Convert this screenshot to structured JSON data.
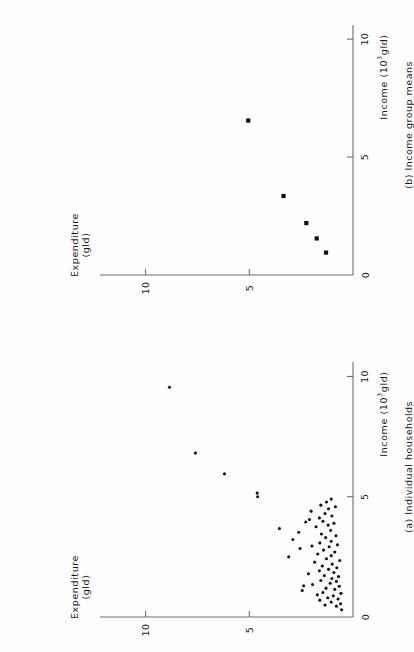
{
  "figure": {
    "orientation": "rotated-90-ccw",
    "background": "#fefefe",
    "ink_color": "#1b1b1b",
    "axis_color": "#6d6d6d",
    "point_color": "#101010"
  },
  "chart_data": [
    {
      "id": "panel-a",
      "type": "scatter",
      "title": "(a) Individual households",
      "xlabel": "Income (10³gld)",
      "ylabel": "Expenditure (gld)",
      "xticks": [
        0,
        5,
        10
      ],
      "xticklabels": [
        "0",
        "5",
        "10"
      ],
      "yticks": [
        0,
        5,
        10
      ],
      "yticklabels": [
        "0",
        "5",
        "10"
      ],
      "xlim": [
        0,
        10.6
      ],
      "ylim": [
        0,
        12.2
      ],
      "grid": false,
      "legend": null,
      "marker": "filled-circle",
      "n_points": 72,
      "points": [
        [
          0.3,
          0.55
        ],
        [
          0.45,
          0.8
        ],
        [
          0.5,
          1.35
        ],
        [
          0.55,
          0.6
        ],
        [
          0.62,
          1.05
        ],
        [
          0.7,
          1.6
        ],
        [
          0.75,
          0.72
        ],
        [
          0.8,
          1.22
        ],
        [
          0.88,
          0.95
        ],
        [
          0.92,
          1.72
        ],
        [
          0.98,
          0.58
        ],
        [
          1.02,
          1.45
        ],
        [
          1.1,
          2.45
        ],
        [
          1.15,
          0.88
        ],
        [
          1.2,
          1.3
        ],
        [
          1.28,
          0.66
        ],
        [
          1.35,
          1.95
        ],
        [
          1.4,
          1.1
        ],
        [
          1.48,
          0.8
        ],
        [
          1.52,
          1.55
        ],
        [
          1.6,
          1.02
        ],
        [
          1.68,
          0.7
        ],
        [
          1.72,
          1.38
        ],
        [
          1.8,
          2.15
        ],
        [
          1.85,
          0.92
        ],
        [
          1.92,
          1.62
        ],
        [
          1.98,
          1.18
        ],
        [
          2.05,
          0.78
        ],
        [
          2.12,
          1.48
        ],
        [
          2.2,
          1.0
        ],
        [
          2.28,
          1.85
        ],
        [
          2.35,
          0.64
        ],
        [
          2.42,
          1.28
        ],
        [
          2.5,
          3.1
        ],
        [
          2.55,
          1.05
        ],
        [
          2.62,
          1.7
        ],
        [
          2.7,
          0.88
        ],
        [
          2.78,
          1.42
        ],
        [
          2.85,
          2.55
        ],
        [
          2.92,
          1.15
        ],
        [
          3.0,
          0.75
        ],
        [
          3.08,
          1.6
        ],
        [
          3.15,
          1.05
        ],
        [
          3.22,
          2.9
        ],
        [
          3.3,
          1.32
        ],
        [
          3.38,
          0.82
        ],
        [
          3.45,
          1.52
        ],
        [
          3.52,
          2.62
        ],
        [
          3.6,
          1.08
        ],
        [
          3.68,
          3.55
        ],
        [
          3.75,
          1.78
        ],
        [
          3.82,
          1.2
        ],
        [
          3.9,
          0.92
        ],
        [
          3.98,
          1.45
        ],
        [
          4.05,
          2.1
        ],
        [
          4.12,
          1.62
        ],
        [
          4.2,
          1.02
        ],
        [
          4.3,
          1.35
        ],
        [
          4.4,
          2.02
        ],
        [
          4.5,
          1.18
        ],
        [
          4.58,
          0.85
        ],
        [
          4.65,
          1.55
        ],
        [
          4.78,
          1.28
        ],
        [
          4.9,
          1.05
        ],
        [
          5.0,
          4.6
        ],
        [
          5.15,
          4.62
        ],
        [
          5.95,
          6.2
        ],
        [
          6.82,
          7.6
        ],
        [
          9.55,
          8.85
        ],
        [
          2.95,
          1.98
        ],
        [
          1.3,
          2.38
        ],
        [
          3.95,
          2.28
        ]
      ],
      "outlier_points": [
        [
          5.0,
          4.6
        ],
        [
          5.15,
          4.62
        ],
        [
          5.95,
          6.2
        ],
        [
          6.82,
          7.6
        ],
        [
          9.55,
          8.85
        ]
      ]
    },
    {
      "id": "panel-b",
      "type": "scatter",
      "title": "(b) Income group means",
      "xlabel": "Income (10³gld)",
      "ylabel": "Expenditure (gld)",
      "xticks": [
        0,
        5,
        10
      ],
      "xticklabels": [
        "0",
        "5",
        "10"
      ],
      "yticks": [
        0,
        5,
        10
      ],
      "yticklabels": [
        "0",
        "5",
        "10"
      ],
      "xlim": [
        0,
        10.6
      ],
      "ylim": [
        0,
        12.2
      ],
      "grid": false,
      "legend": null,
      "marker": "filled-square",
      "n_points": 5,
      "points": [
        [
          0.95,
          1.3
        ],
        [
          1.55,
          1.75
        ],
        [
          2.2,
          2.25
        ],
        [
          3.35,
          3.35
        ],
        [
          6.55,
          5.05
        ]
      ]
    }
  ]
}
